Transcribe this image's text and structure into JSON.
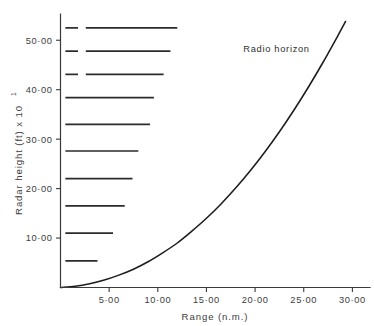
{
  "chart_data": {
    "type": "line",
    "title": "",
    "xlabel": "Range  (n.m.)",
    "ylabel": "Radar  height  (ft)  x  10",
    "ylabel_exponent": "1",
    "xlim": [
      0,
      31.5
    ],
    "ylim": [
      0,
      55
    ],
    "grid": false,
    "legend": false,
    "xticks": [
      5,
      10,
      15,
      20,
      25,
      30
    ],
    "xticklabels": [
      "5·00",
      "10·00",
      "15·00",
      "20·00",
      "25·00",
      "30·00"
    ],
    "yticks": [
      10,
      20,
      30,
      40,
      50
    ],
    "yticklabels": [
      "10·00",
      "20·00",
      "30·00",
      "40·00",
      "50·00"
    ],
    "annotations": [
      {
        "text": "Radio horizon",
        "x": 22.2,
        "y": 47.6
      }
    ],
    "series": [
      {
        "name": "Radio horizon",
        "type": "curve",
        "x": [
          0.0,
          1.5,
          3.0,
          4.5,
          6.0,
          7.5,
          9.0,
          10.5,
          12.0,
          13.5,
          15.0,
          16.5,
          18.0,
          19.5,
          21.0,
          22.5,
          24.0,
          25.5,
          27.0,
          28.5,
          29.3
        ],
        "y": [
          0.0,
          0.25,
          0.75,
          1.5,
          2.5,
          3.7,
          5.2,
          7.0,
          9.0,
          11.4,
          14.0,
          16.9,
          20.1,
          23.6,
          27.4,
          31.5,
          35.9,
          40.6,
          45.6,
          50.9,
          53.8
        ]
      },
      {
        "name": "Radar height levels",
        "type": "hlines",
        "lines": [
          {
            "y": 52.5,
            "x_start": 0.5,
            "x_end": 12.0,
            "gap_start": 1.8,
            "gap_end": 2.6
          },
          {
            "y": 47.8,
            "x_start": 0.5,
            "x_end": 11.3,
            "gap_start": 1.8,
            "gap_end": 2.6
          },
          {
            "y": 43.1,
            "x_start": 0.5,
            "x_end": 10.6,
            "gap_start": 1.8,
            "gap_end": 2.6
          },
          {
            "y": 38.4,
            "x_start": 0.5,
            "x_end": 9.6,
            "gap_start": null,
            "gap_end": null
          },
          {
            "y": 33.0,
            "x_start": 0.5,
            "x_end": 9.2,
            "gap_start": null,
            "gap_end": null
          },
          {
            "y": 27.6,
            "x_start": 0.5,
            "x_end": 8.0,
            "gap_start": null,
            "gap_end": null
          },
          {
            "y": 22.0,
            "x_start": 0.5,
            "x_end": 7.4,
            "gap_start": null,
            "gap_end": null
          },
          {
            "y": 16.5,
            "x_start": 0.5,
            "x_end": 6.6,
            "gap_start": null,
            "gap_end": null
          },
          {
            "y": 11.0,
            "x_start": 0.5,
            "x_end": 5.4,
            "gap_start": null,
            "gap_end": null
          },
          {
            "y": 5.4,
            "x_start": 0.5,
            "x_end": 3.8,
            "gap_start": null,
            "gap_end": null
          }
        ]
      }
    ]
  },
  "axis_text": {
    "x_title": "Range  (n.m.)",
    "y_title_main": "Radar  height  (ft)  x  10",
    "y_title_sup": "1"
  },
  "colors": {
    "background": "#ffffff",
    "axis": "#3a3a3a",
    "curve": "#1d1d1d",
    "height_lines": "#2b2b2b",
    "text": "#3d3d3d"
  }
}
